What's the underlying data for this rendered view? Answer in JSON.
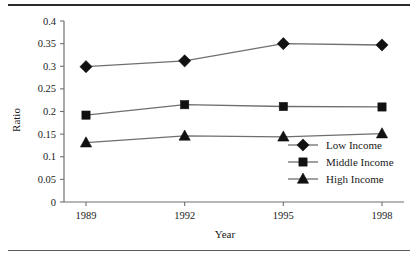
{
  "chart_data": {
    "type": "line",
    "title": "",
    "xlabel": "Year",
    "ylabel": "Ratio",
    "categories": [
      "1989",
      "1992",
      "1995",
      "1998"
    ],
    "x": [
      1989,
      1992,
      1995,
      1998
    ],
    "xlim": [
      1987.5,
      1999.5
    ],
    "ylim": [
      0,
      0.4
    ],
    "grid": false,
    "legend_position": "bottom-right",
    "y_ticks": [
      "0",
      "0.05",
      "0.1",
      "0.15",
      "0.2",
      "0.25",
      "0.3",
      "0.35",
      "0.4"
    ],
    "y_tick_values": [
      0,
      0.05,
      0.1,
      0.15,
      0.2,
      0.25,
      0.3,
      0.35,
      0.4
    ],
    "x_ticks": [
      "1989",
      "1992",
      "1995",
      "1998"
    ],
    "series": [
      {
        "name": "Low Income",
        "marker": "diamond",
        "values": [
          0.299,
          0.312,
          0.35,
          0.347
        ]
      },
      {
        "name": "Middle Income",
        "marker": "square",
        "values": [
          0.192,
          0.215,
          0.211,
          0.21
        ]
      },
      {
        "name": "High Income",
        "marker": "triangle",
        "values": [
          0.131,
          0.146,
          0.144,
          0.151
        ]
      }
    ],
    "colors": {
      "marker": "#111111",
      "line": "#6f6f6f",
      "axis": "#6f6f6f",
      "text": "#1a1a1a",
      "background": "#ffffff"
    }
  },
  "legend": {
    "items": [
      {
        "label": "Low Income",
        "marker": "diamond"
      },
      {
        "label": "Middle Income",
        "marker": "square"
      },
      {
        "label": "High Income",
        "marker": "triangle"
      }
    ]
  }
}
